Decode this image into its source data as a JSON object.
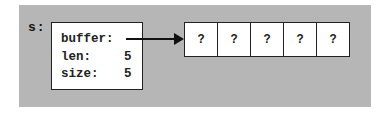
{
  "diagram": {
    "variable_name": "s:",
    "struct": {
      "fields": [
        {
          "name": "buffer:",
          "value": ""
        },
        {
          "name": "len:",
          "value": "5"
        },
        {
          "name": "size:",
          "value": "5"
        }
      ]
    },
    "pointer": {
      "from": "buffer",
      "to": "array"
    },
    "array": {
      "cells": [
        "?",
        "?",
        "?",
        "?",
        "?"
      ]
    },
    "colors": {
      "panel_background": "#b6b6b6",
      "box_fill": "#ffffff",
      "stroke": "#222222"
    }
  }
}
